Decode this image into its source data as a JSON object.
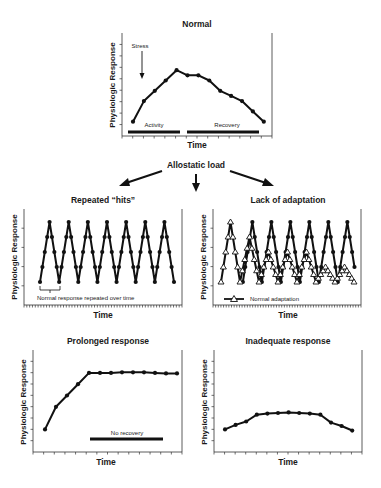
{
  "figure": {
    "central_label": "Allostatic load",
    "y_axis_label": "Physiologic Response",
    "x_axis_label": "Time"
  },
  "chart_data": [
    {
      "id": "normal",
      "type": "line",
      "title": "Normal",
      "xlabel": "Time",
      "ylabel": "Physiologic Response",
      "x": [
        1,
        2,
        3,
        4,
        5,
        6,
        7,
        8,
        9,
        10,
        11,
        12,
        13
      ],
      "values": [
        2,
        4,
        5,
        6,
        7,
        6.5,
        6.5,
        6,
        5,
        4.5,
        4,
        3,
        2
      ],
      "annotations": [
        {
          "text": "Stress",
          "type": "arrow",
          "target_x": 2
        },
        {
          "text": "Activity",
          "type": "bar",
          "from": 0.8,
          "to": 5.5
        },
        {
          "text": "Recovery",
          "type": "bar",
          "from": 6,
          "to": 13.2
        }
      ],
      "ylim": [
        0,
        9
      ],
      "grid": false
    },
    {
      "id": "repeated-hits",
      "type": "line",
      "title": "Repeated “hits”",
      "xlabel": "Time",
      "ylabel": "Physiologic Response",
      "series": [
        {
          "name": "Repeated response",
          "marker": "circle",
          "values": [
            1,
            2,
            3,
            4,
            5,
            4,
            3,
            2,
            1,
            2,
            3,
            4,
            5,
            4,
            3,
            2,
            1,
            2,
            3,
            4,
            5,
            4,
            3,
            2,
            1,
            2,
            3,
            4,
            5,
            4,
            3,
            2,
            1,
            2,
            3,
            4,
            5,
            4,
            3,
            2,
            1,
            2,
            3,
            4,
            5,
            4,
            3,
            2,
            1,
            2,
            3,
            4,
            5,
            4,
            3,
            2,
            1
          ]
        }
      ],
      "annotations": [
        {
          "text": "Normal response repeated over time",
          "type": "bracket"
        }
      ],
      "peaks": 7,
      "ylim": [
        0,
        5.5
      ],
      "grid": false
    },
    {
      "id": "lack-of-adaptation",
      "type": "line",
      "title": "Lack of adaptation",
      "xlabel": "Time",
      "ylabel": "Physiologic Response",
      "series": [
        {
          "name": "Non-adapting response",
          "marker": "circle",
          "peaks": [
            5,
            5,
            5,
            5,
            5,
            5,
            5
          ]
        },
        {
          "name": "Normal adaptation",
          "marker": "triangle-open",
          "peaks": [
            5,
            4,
            3,
            3,
            3,
            2,
            2
          ]
        }
      ],
      "legend": [
        {
          "label": "Normal adaptation",
          "marker": "triangle-open"
        }
      ],
      "ylim": [
        0,
        5.5
      ],
      "grid": false
    },
    {
      "id": "prolonged-response",
      "type": "line",
      "title": "Prolonged response",
      "xlabel": "Time",
      "ylabel": "Physiologic Response",
      "x": [
        1,
        2,
        3,
        4,
        5,
        6,
        7,
        8,
        9,
        10,
        11,
        12,
        13
      ],
      "values": [
        2,
        4,
        5,
        6,
        7,
        7,
        7,
        7.05,
        7.05,
        7.05,
        7,
        6.95,
        6.95
      ],
      "annotations": [
        {
          "text": "No recovery",
          "type": "bar",
          "from": 5.5,
          "to": 12.2
        }
      ],
      "ylim": [
        0,
        9
      ],
      "grid": false
    },
    {
      "id": "inadequate-response",
      "type": "line",
      "title": "Inadequate response",
      "xlabel": "Time",
      "ylabel": "Physiologic Response",
      "x": [
        1,
        2,
        3,
        4,
        5,
        6,
        7,
        8,
        9,
        10,
        11,
        12,
        13
      ],
      "values": [
        2,
        2.4,
        2.7,
        3.3,
        3.4,
        3.45,
        3.5,
        3.45,
        3.4,
        3.3,
        2.6,
        2.3,
        1.9
      ],
      "ylim": [
        0,
        9
      ],
      "grid": false
    }
  ]
}
